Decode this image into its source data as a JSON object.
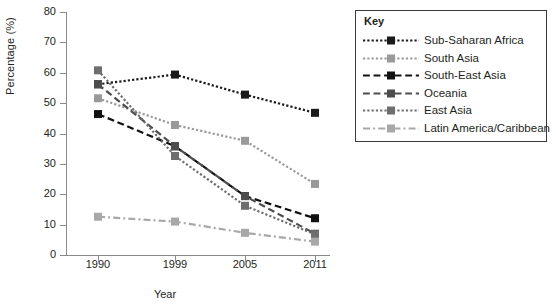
{
  "chart_data": {
    "type": "line",
    "title": "",
    "xlabel": "Year",
    "ylabel": "Percentage (%)",
    "categories": [
      "1990",
      "1999",
      "2005",
      "2011"
    ],
    "x": [
      1990,
      1999,
      2005,
      2011
    ],
    "ylim": [
      0,
      80
    ],
    "yticks": [
      0,
      10,
      20,
      30,
      40,
      50,
      60,
      70,
      80
    ],
    "grid": false,
    "legend_position": "right",
    "legend_title": "Key",
    "series": [
      {
        "name": "Sub-Saharan Africa",
        "values": [
          56.2,
          59.4,
          52.8,
          46.8
        ],
        "color": "#1a1a1a",
        "line_style": "dotted",
        "marker": "square"
      },
      {
        "name": "South Asia",
        "values": [
          51.6,
          42.8,
          37.6,
          23.4
        ],
        "color": "#9a9a9a",
        "line_style": "dotted",
        "marker": "square"
      },
      {
        "name": "South-East Asia",
        "values": [
          46.4,
          35.8,
          19.4,
          12.1
        ],
        "color": "#111111",
        "line_style": "dashed",
        "marker": "square"
      },
      {
        "name": "Oceania",
        "values": [
          56.2,
          35.8,
          19.4,
          7.0
        ],
        "color": "#4d4d4d",
        "line_style": "dashed",
        "marker": "square"
      },
      {
        "name": "East Asia",
        "values": [
          60.8,
          32.6,
          16.2,
          6.8
        ],
        "color": "#6e6e6e",
        "line_style": "dotted",
        "marker": "square"
      },
      {
        "name": "Latin America/Caribbean",
        "values": [
          12.6,
          11.0,
          7.3,
          4.4
        ],
        "color": "#a8a8a8",
        "line_style": "dash-dot",
        "marker": "square"
      }
    ]
  },
  "axes": {
    "y_title": "Percentage (%)",
    "x_title": "Year",
    "y_tick_labels": [
      "80",
      "70",
      "60",
      "50",
      "40",
      "30",
      "20",
      "10",
      "0"
    ],
    "x_tick_labels": [
      "1990",
      "1999",
      "2005",
      "2011"
    ]
  },
  "legend": {
    "title": "Key",
    "items": [
      {
        "label": "Sub-Saharan Africa"
      },
      {
        "label": "South Asia"
      },
      {
        "label": "South-East Asia"
      },
      {
        "label": "Oceania"
      },
      {
        "label": "East Asia"
      },
      {
        "label": "Latin America/Caribbean"
      }
    ]
  }
}
